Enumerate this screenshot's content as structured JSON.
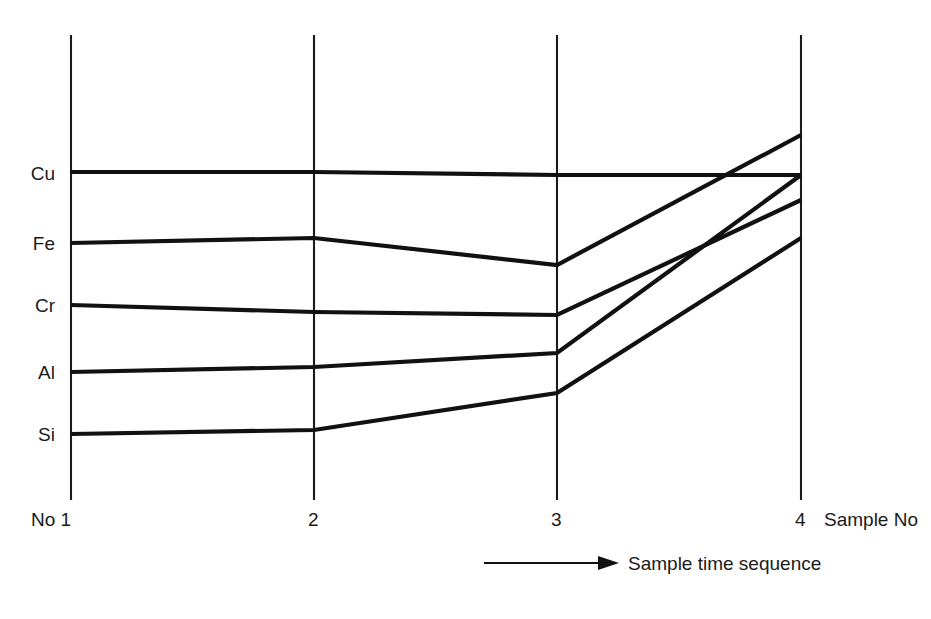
{
  "figure": {
    "background_color": "#ffffff",
    "line_color": "#111111",
    "axis_color": "#1b1b1b",
    "width": 931,
    "height": 619
  },
  "axis": {
    "x_title": "Sample No",
    "x_first_label": "No 1",
    "tick_labels": [
      "No 1",
      "2",
      "3",
      "4"
    ],
    "y_labels": [
      "Cu",
      "Fe",
      "Cr",
      "Al",
      "Si"
    ]
  },
  "annotation": {
    "arrow_label": "Sample time sequence",
    "arrow_icon": "right-arrow-icon"
  },
  "chart_data": {
    "type": "line",
    "title": "",
    "subtitle": "",
    "xlabel": "Sample No",
    "ylabel": "",
    "x": [
      1,
      2,
      3,
      4
    ],
    "tick_labels": [
      "No 1",
      "2",
      "3",
      "4"
    ],
    "annotations": [
      "Sample time sequence"
    ],
    "legend_position": "y-axis-left-labels",
    "grid": false,
    "axis_style": "four-vertical-parallel-axes",
    "ylim": [
      0,
      100
    ],
    "y_category_positions": {
      "Cu": 73,
      "Fe": 58,
      "Cr": 45,
      "Al": 31,
      "Si": 17
    },
    "series": [
      {
        "name": "Cu",
        "values": [
          73.0,
          73.0,
          72.4,
          72.4
        ],
        "pixel_y": [
          172,
          172,
          175,
          175
        ]
      },
      {
        "name": "Fe",
        "values": [
          57.8,
          58.9,
          53.1,
          80.9
        ],
        "pixel_y": [
          243,
          238,
          265,
          135
        ]
      },
      {
        "name": "Al",
        "values": [
          30.4,
          31.5,
          34.6,
          72.4
        ],
        "pixel_y": [
          372,
          367,
          353,
          175
        ]
      },
      {
        "name": "Cr",
        "values": [
          44.4,
          42.9,
          42.3,
          67.0
        ],
        "pixel_y": [
          305,
          312,
          315,
          200
        ]
      },
      {
        "name": "Si",
        "values": [
          16.3,
          17.2,
          25.2,
          58.9
        ],
        "pixel_y": [
          434,
          430,
          393,
          238
        ]
      }
    ]
  }
}
